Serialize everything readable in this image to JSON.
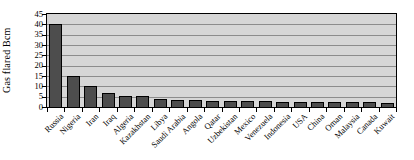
{
  "chart_data": {
    "type": "bar",
    "title": "",
    "xlabel": "",
    "ylabel": "Gas flared Bcm",
    "unit": "Bcm",
    "ylim": [
      0,
      45
    ],
    "ytick_step": 5,
    "yticks": [
      0,
      5,
      10,
      15,
      20,
      25,
      30,
      35,
      40,
      45
    ],
    "grid": true,
    "legend": false,
    "categories": [
      "Russia",
      "Nigeria",
      "Iran",
      "Iraq",
      "Algeria",
      "Kazakhstan",
      "Libya",
      "Saudi Arabia",
      "Angola",
      "Qatar",
      "Uzbekistan",
      "Mexico",
      "Venezuela",
      "Indonesia",
      "USA",
      "China",
      "Oman",
      "Malaysia",
      "Canada",
      "Kuwait"
    ],
    "values": [
      40,
      15,
      10.4,
      7,
      5.5,
      5.4,
      3.8,
      3.6,
      3.2,
      3.0,
      2.9,
      2.8,
      2.7,
      2.6,
      2.5,
      2.5,
      2.3,
      2.4,
      2.2,
      2.1
    ],
    "colors": {
      "bar_fill": "#4d4d4d",
      "bar_border": "#000000",
      "plot_background": "#d6d6d6",
      "gridline": "#8c8c8c",
      "axis_line": "#000000",
      "page_background": "#ffffff",
      "text": "#000000"
    }
  }
}
